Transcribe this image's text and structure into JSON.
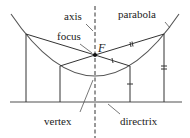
{
  "diagram": {
    "labels": {
      "axis": "axis",
      "focus": "focus",
      "focus_symbol": "F",
      "parabola": "parabola",
      "vertex": "vertex",
      "directrix": "directrix"
    },
    "colors": {
      "line": "#333333",
      "parabola": "#555555",
      "directrix": "#888888",
      "text": "#222222"
    },
    "points": {
      "focus": [
        95,
        55
      ],
      "vertex": [
        95,
        78
      ],
      "P1": [
        26,
        34
      ],
      "P2": [
        60,
        66
      ],
      "P3": [
        164,
        34
      ],
      "P4": [
        130,
        66
      ]
    },
    "directrix_y": 102
  }
}
